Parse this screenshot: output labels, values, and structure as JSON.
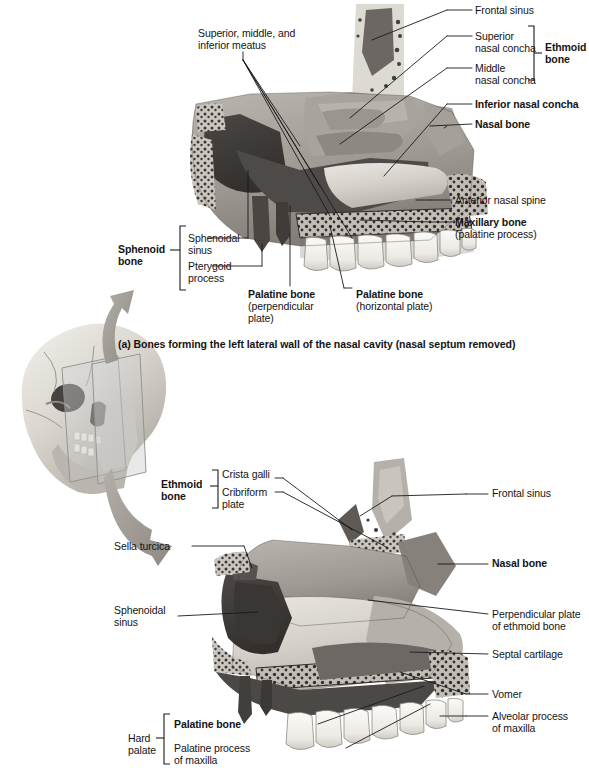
{
  "figure": {
    "background_color": "#ffffff",
    "line_color": "#1a1a1a",
    "text_color": "#141414"
  },
  "skull_inset": {
    "name": "lateral-skull-with-sagittal-planes",
    "description": "Lateral view of human skull with two translucent sagittal section planes"
  },
  "panel_a": {
    "caption": "(a) Bones forming the left lateral wall of the nasal cavity (nasal septum removed)",
    "artwork_name": "left-lateral-nasal-cavity-wall",
    "labels": [
      {
        "id": "meatus",
        "text": "Superior, middle, and\ninferior meatus",
        "bold": false,
        "align": "left"
      },
      {
        "id": "frontal-sinus",
        "text": "Frontal sinus",
        "bold": false,
        "align": "left"
      },
      {
        "id": "superior-concha",
        "text": "Superior\nnasal concha",
        "bold": false,
        "align": "left"
      },
      {
        "id": "middle-concha",
        "text": "Middle\nnasal concha",
        "bold": false,
        "align": "left"
      },
      {
        "id": "ethmoid-bone",
        "text": "Ethmoid\nbone",
        "bold": true,
        "align": "left"
      },
      {
        "id": "inferior-concha",
        "text": "Inferior nasal concha",
        "bold": true,
        "align": "left"
      },
      {
        "id": "nasal-bone",
        "text": "Nasal bone",
        "bold": true,
        "align": "left"
      },
      {
        "id": "anterior-nasal-spine",
        "text": "Anterior nasal spine",
        "bold": false,
        "align": "left"
      },
      {
        "id": "maxillary-bone",
        "text": "Maxillary bone",
        "bold": true,
        "align": "left"
      },
      {
        "id": "maxillary-bone-sub",
        "text": "(palatine process)",
        "bold": false,
        "align": "left"
      },
      {
        "id": "sphenoid-bone",
        "text": "Sphenoid\nbone",
        "bold": true,
        "align": "left"
      },
      {
        "id": "sphenoidal-sinus",
        "text": "Sphenoidal\nsinus",
        "bold": false,
        "align": "left"
      },
      {
        "id": "pterygoid-process",
        "text": "Pterygoid\nprocess",
        "bold": false,
        "align": "left"
      },
      {
        "id": "palatine-bone-perp",
        "text": "Palatine bone",
        "bold": true,
        "align": "left"
      },
      {
        "id": "palatine-bone-perp-sub",
        "text": "(perpendicular\nplate)",
        "bold": false,
        "align": "left"
      },
      {
        "id": "palatine-bone-horiz",
        "text": "Palatine bone",
        "bold": true,
        "align": "left"
      },
      {
        "id": "palatine-bone-horiz-sub",
        "text": "(horizontal plate)",
        "bold": false,
        "align": "left"
      }
    ]
  },
  "panel_b": {
    "caption": "",
    "artwork_name": "nasal-septum-medial-view",
    "labels": [
      {
        "id": "ethmoid-bone-b",
        "text": "Ethmoid\nbone",
        "bold": true,
        "align": "left"
      },
      {
        "id": "crista-galli",
        "text": "Crista galli",
        "bold": false,
        "align": "left"
      },
      {
        "id": "cribriform-plate",
        "text": "Cribriform\nplate",
        "bold": false,
        "align": "left"
      },
      {
        "id": "frontal-sinus-b",
        "text": "Frontal sinus",
        "bold": false,
        "align": "left"
      },
      {
        "id": "sella-turcica",
        "text": "Sella turcica",
        "bold": false,
        "align": "left"
      },
      {
        "id": "nasal-bone-b",
        "text": "Nasal bone",
        "bold": true,
        "align": "left"
      },
      {
        "id": "sphenoidal-sinus-b",
        "text": "Sphenoidal\nsinus",
        "bold": false,
        "align": "left"
      },
      {
        "id": "perpendicular-plate",
        "text": "Perpendicular plate\nof ethmoid bone",
        "bold": false,
        "align": "left"
      },
      {
        "id": "septal-cartilage",
        "text": "Septal cartilage",
        "bold": false,
        "align": "left"
      },
      {
        "id": "vomer",
        "text": "Vomer",
        "bold": false,
        "align": "left"
      },
      {
        "id": "alveolar-process",
        "text": "Alveolar process\nof maxilla",
        "bold": false,
        "align": "left"
      },
      {
        "id": "hard-palate",
        "text": "Hard\npalate",
        "bold": false,
        "align": "left"
      },
      {
        "id": "palatine-bone-b",
        "text": "Palatine bone",
        "bold": true,
        "align": "left"
      },
      {
        "id": "palatine-process",
        "text": "Palatine process\nof maxilla",
        "bold": false,
        "align": "left"
      }
    ]
  }
}
